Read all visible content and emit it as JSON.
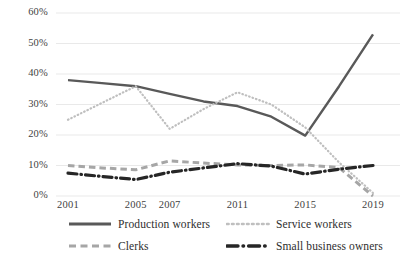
{
  "chart_data": {
    "type": "line",
    "title": "",
    "subtitle": "",
    "xlabel": "",
    "ylabel": "",
    "categories": [
      "2001",
      "2003",
      "2005",
      "2007",
      "2009",
      "2011",
      "2013",
      "2015",
      "2017",
      "2019"
    ],
    "xtick_labels": [
      "2001",
      "2005",
      "2007",
      "2011",
      "2015",
      "2019"
    ],
    "ytick_labels": [
      "0%",
      "10%",
      "20%",
      "30%",
      "40%",
      "50%",
      "60%"
    ],
    "ylim": [
      0,
      60
    ],
    "ytick_values": [
      0,
      10,
      20,
      30,
      40,
      50,
      60
    ],
    "grid": "horizontal",
    "legend_position": "bottom",
    "series": [
      {
        "name": "Production workers",
        "style": "solid",
        "color": "#595959",
        "values": [
          38,
          37,
          36,
          33.5,
          31,
          29.5,
          26,
          19.8,
          36,
          53
        ]
      },
      {
        "name": "Service workers",
        "style": "dotted",
        "color": "#bfbfbf",
        "values": [
          25,
          30.5,
          36,
          22,
          28.5,
          34,
          30,
          22.5,
          11,
          1
        ]
      },
      {
        "name": "Clerks",
        "style": "dashed",
        "color": "#a6a6a6",
        "values": [
          10,
          9.2,
          8.6,
          11.5,
          10.8,
          10.2,
          10,
          10.2,
          9.3,
          0
        ]
      },
      {
        "name": "Small business owners",
        "style": "dashdot",
        "color": "#262626",
        "values": [
          7.5,
          6.4,
          5.4,
          7.8,
          9.2,
          10.6,
          9.8,
          7.2,
          8.8,
          10
        ]
      }
    ]
  },
  "legend": {
    "items": [
      {
        "label": "Production workers"
      },
      {
        "label": "Service workers"
      },
      {
        "label": "Clerks"
      },
      {
        "label": "Small business owners"
      }
    ]
  },
  "colors": {
    "grid": "#e6e6e6",
    "text": "#3f3f3f",
    "background": "#ffffff"
  }
}
